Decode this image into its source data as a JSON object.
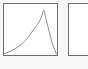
{
  "page": {
    "background_color": "#f7f7f7",
    "panel_count": 2
  },
  "panels": [
    {
      "name": "curve-thumbnail",
      "border_color": "#6e6e6e",
      "fill_color": "#ffffff",
      "has_chart": true
    },
    {
      "name": "empty-thumbnail",
      "border_color": "#6e6e6e",
      "fill_color": "#ffffff",
      "has_chart": false
    }
  ],
  "chart_data": {
    "type": "line",
    "title": "",
    "xlabel": "",
    "ylabel": "",
    "xlim": [
      0,
      100
    ],
    "ylim": [
      0,
      100
    ],
    "grid": false,
    "legend": null,
    "line_color": "#3a3a3a",
    "series": [
      {
        "name": "asymmetric-peak",
        "x": [
          0,
          8,
          16,
          24,
          32,
          40,
          48,
          56,
          62,
          68,
          72,
          76,
          80,
          86,
          92,
          100
        ],
        "values": [
          2,
          5,
          9,
          14,
          20,
          28,
          38,
          50,
          58,
          68,
          78,
          88,
          70,
          46,
          22,
          1
        ]
      }
    ],
    "annotations": [
      {
        "label": "peak",
        "x": 76,
        "y": 88
      }
    ]
  }
}
